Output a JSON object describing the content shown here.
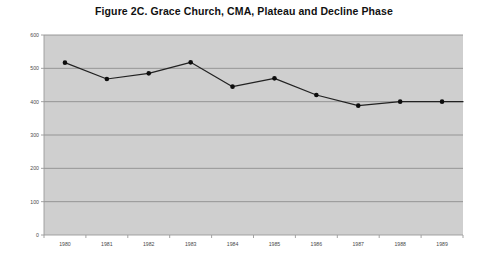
{
  "figure": {
    "title": "Figure 2C. Grace Church, CMA, Plateau and Decline Phase"
  },
  "chart_data": {
    "type": "line",
    "title": "Figure 2C. Grace Church, CMA, Plateau and Decline Phase",
    "xlabel": "",
    "ylabel": "",
    "categories": [
      "1980",
      "1981",
      "1982",
      "1983",
      "1984",
      "1985",
      "1986",
      "1987",
      "1988",
      "1989"
    ],
    "values": [
      517,
      468,
      485,
      518,
      445,
      470,
      420,
      388,
      400,
      400
    ],
    "series": [
      {
        "name": "Grace Church, CMA attendance",
        "values": [
          517,
          468,
          485,
          518,
          445,
          470,
          420,
          388,
          400,
          400
        ]
      }
    ],
    "ylim": [
      0,
      600
    ],
    "yticks": [
      0,
      100,
      200,
      300,
      400,
      500,
      600
    ],
    "ytick_labels": [
      "0",
      "100",
      "200",
      "300",
      "400",
      "500",
      "600"
    ],
    "xtick_labels": [
      "1980",
      "1981",
      "1982",
      "1983",
      "1984",
      "1985",
      "1986",
      "1987",
      "1988",
      "1989"
    ],
    "grid": true,
    "grid_axis": "y",
    "legend": false,
    "legend_position": "none",
    "marker": "filled-circle",
    "line_color": "#222222",
    "marker_color": "#0d0d0d",
    "plot_background": "#cfcfcf",
    "gridline_color": "#8e8e8e"
  }
}
